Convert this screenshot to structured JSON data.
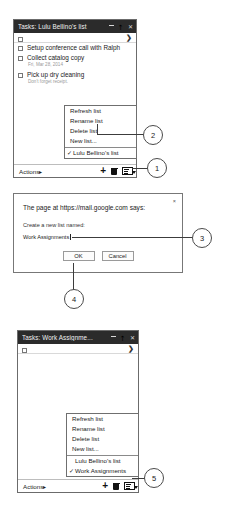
{
  "panel1": {
    "title": "Tasks: Lulu Bellino's list",
    "titlebar_buttons": [
      "minimize",
      "popout",
      "close"
    ],
    "expand_arrow": "❯",
    "tasks": [
      {
        "text": "",
        "sub": ""
      },
      {
        "text": "Setup conference call with Ralph",
        "sub": ""
      },
      {
        "text": "Collect catalog copy",
        "sub": "Fri, Mar 28, 2014"
      },
      {
        "text": "Pick up dry cleaning",
        "sub": "Don't forget receipt."
      }
    ],
    "menu": {
      "items": [
        "Refresh list",
        "Rename list",
        "Delete list",
        "New list..."
      ],
      "lists": [
        {
          "label": "Lulu Bellino's list",
          "checked": true
        }
      ]
    },
    "footer": {
      "actions_label": "Actions",
      "actions_caret": "▸",
      "add_icon": "+",
      "delete_icon": "trash",
      "list_icon": "list"
    }
  },
  "dialog": {
    "header": "The page at https://mail.google.com says:",
    "close_label": "×",
    "prompt_label": "Create a new list named:",
    "input_value": "Work Assignments",
    "ok_label": "OK",
    "cancel_label": "Cancel"
  },
  "panel3": {
    "title": "Tasks: Work Assignme...",
    "expand_arrow": "❯",
    "tasks": [
      {
        "text": "",
        "sub": ""
      }
    ],
    "menu": {
      "items": [
        "Refresh list",
        "Rename list",
        "Delete list",
        "New list..."
      ],
      "lists": [
        {
          "label": "Lulu Bellino's list",
          "checked": false
        },
        {
          "label": "Work Assignments",
          "checked": true
        }
      ]
    },
    "footer": {
      "actions_label": "Actions",
      "actions_caret": "▸",
      "add_icon": "+",
      "delete_icon": "trash",
      "list_icon": "list"
    }
  },
  "callouts": [
    {
      "number": "1"
    },
    {
      "number": "2"
    },
    {
      "number": "3"
    },
    {
      "number": "4"
    },
    {
      "number": "5"
    }
  ],
  "check_glyph": "✓"
}
